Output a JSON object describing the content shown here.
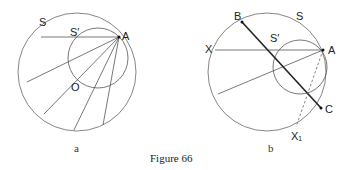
{
  "figure": {
    "caption": "Figure 66",
    "panels": [
      {
        "id": "a",
        "sublabel": "a",
        "labels": {
          "big_circle": "S",
          "small_circle": "S′",
          "point_A": "A",
          "center": "O"
        }
      },
      {
        "id": "b",
        "sublabel": "b",
        "labels": {
          "big_circle": "S",
          "small_circle": "S′",
          "point_A": "A",
          "point_B": "B",
          "point_C": "C",
          "point_X": "X",
          "point_X1": "X₁"
        }
      }
    ]
  },
  "colors": {
    "line": "#555555",
    "bold_line": "#222222",
    "text": "#222222"
  }
}
